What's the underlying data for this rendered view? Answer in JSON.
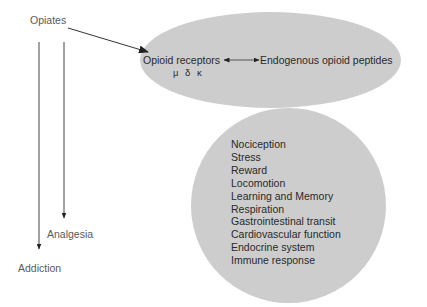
{
  "diagram": {
    "source_node": {
      "label": "Opiates"
    },
    "receptor_node": {
      "receptors_label": "Opioid receptors",
      "subtypes": "μ δ κ",
      "peptides_label": "Endogenous opioid peptides"
    },
    "effects_node": {
      "items": [
        "Nociception",
        "Stress",
        "Reward",
        "Locomotion",
        "Learning and Memory",
        "Respiration",
        "Gastrointestinal transit",
        "Cardiovascular function",
        "Endocrine system",
        "Immune response"
      ]
    },
    "outcomes": {
      "analgesia": "Analgesia",
      "addiction": "Addiction"
    },
    "edges": [
      {
        "from": "Opiates",
        "to": "Opioid receptors",
        "type": "arrow"
      },
      {
        "from": "Opioid receptors",
        "to": "Endogenous opioid peptides",
        "type": "bidirectional"
      },
      {
        "from": "Opiates",
        "to": "Analgesia",
        "type": "arrow"
      },
      {
        "from": "Opiates",
        "to": "Addiction",
        "type": "arrow"
      }
    ],
    "colors": {
      "ellipse_fill": "#cdcdcd",
      "line": "#333333",
      "text": "#2a2a2a"
    }
  }
}
